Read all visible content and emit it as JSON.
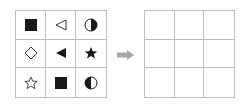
{
  "puzzle": {
    "source_grid": {
      "cells": [
        {
          "row": 1,
          "col": 1,
          "icon": "filled-square"
        },
        {
          "row": 1,
          "col": 2,
          "icon": "outline-triangle-left"
        },
        {
          "row": 1,
          "col": 3,
          "icon": "half-circle-right-filled"
        },
        {
          "row": 2,
          "col": 1,
          "icon": "outline-diamond"
        },
        {
          "row": 2,
          "col": 2,
          "icon": "filled-triangle-left"
        },
        {
          "row": 2,
          "col": 3,
          "icon": "filled-star"
        },
        {
          "row": 3,
          "col": 1,
          "icon": "outline-star"
        },
        {
          "row": 3,
          "col": 2,
          "icon": "filled-square"
        },
        {
          "row": 3,
          "col": 3,
          "icon": "half-circle-left-filled"
        }
      ]
    },
    "arrow": {
      "icon": "arrow-right",
      "color": "#a6a6a6"
    },
    "target_grid": {
      "cells": [
        "",
        "",
        "",
        "",
        "",
        "",
        "",
        "",
        ""
      ]
    },
    "colors": {
      "grid_line": "#bdbdbd",
      "shape": "#1a1a1a"
    }
  }
}
